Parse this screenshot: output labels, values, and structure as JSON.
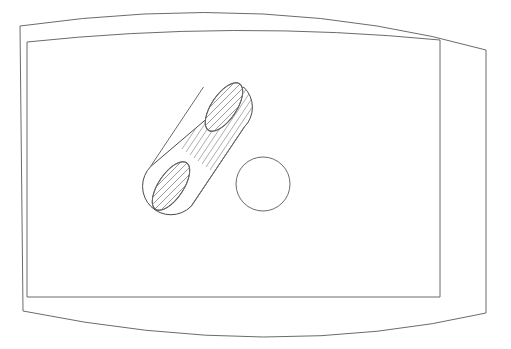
{
  "drawing": {
    "title": "Technical line drawing of a cylindrical boss on a curved plate",
    "background_color": "#ffffff",
    "line_color": "#6b6b6b",
    "part_line_color": "#4a4a4a",
    "hatch_color": "#808080",
    "canvas": {
      "width": 511,
      "height": 349
    },
    "shapes": {
      "outer_plate": {
        "name": "outer-curved-plate",
        "description": "Barrel-shaped outline with bowed top and bottom edges and straight left and right sides",
        "left_x": 20,
        "right_x": 486,
        "top_left_y": 26,
        "top_right_y": 50,
        "top_apex_y": 14,
        "bottom_left_y": 311,
        "bottom_right_y": 313,
        "bottom_apex_y": 337
      },
      "inner_panel": {
        "name": "inner-rectangular-panel",
        "description": "Inner rectangle with slightly curved top edge, offset inside the plate outline",
        "left_x": 27,
        "right_x": 440,
        "top_left_y": 42,
        "top_right_y": 40,
        "bottom_y": 297
      },
      "cylinder": {
        "name": "hatched-cylinder-boss",
        "description": "Cylindrical boss drawn at a 45 degree diagonal with section hatching",
        "top_center_x": 224,
        "top_center_y": 107,
        "bottom_center_x": 171,
        "bottom_center_y": 186,
        "radius": 28,
        "cap_ellipse_ry": 12,
        "hatch_spacing": 5,
        "hatch_count_body": 14,
        "hatch_count_cap": 10
      },
      "hole": {
        "name": "circular-hole",
        "description": "Plain circular through-hole to the right of the cylinder",
        "center_x": 263,
        "center_y": 184,
        "radius": 27
      }
    }
  }
}
